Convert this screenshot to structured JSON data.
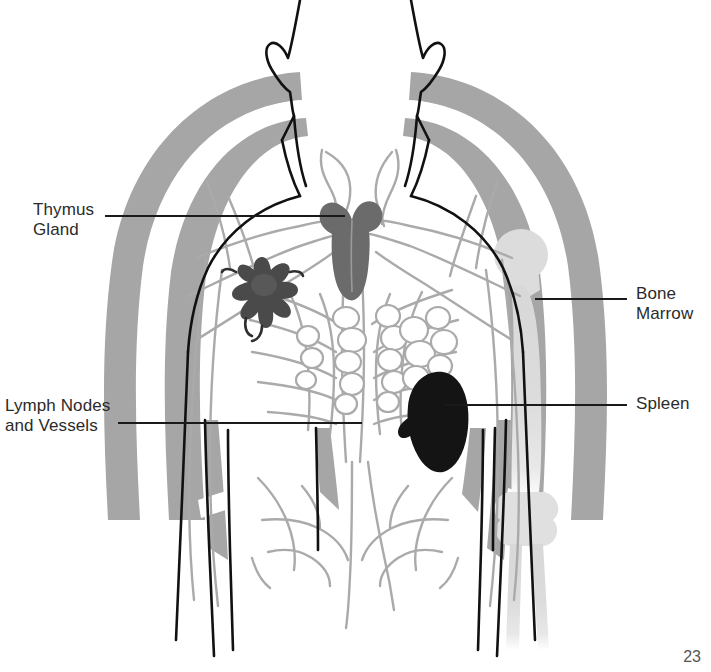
{
  "figure": {
    "page_number": "23",
    "background_color": "#ffffff",
    "labels": [
      {
        "id": "thymus",
        "text": "Thymus\nGland",
        "side": "left",
        "leader_line": {
          "x1": 105,
          "y1": 216,
          "x2": 345,
          "y2": 216
        }
      },
      {
        "id": "lymph",
        "text": "Lymph Nodes\nand Vessels",
        "side": "left",
        "leader_line": {
          "x1": 118,
          "y1": 423,
          "x2": 362,
          "y2": 423
        }
      },
      {
        "id": "bone-marrow",
        "text": "Bone\nMarrow",
        "side": "right",
        "leader_line": {
          "x1": 535,
          "y1": 299,
          "x2": 627,
          "y2": 299
        }
      },
      {
        "id": "spleen",
        "text": "Spleen",
        "side": "right",
        "leader_line": {
          "x1": 445,
          "y1": 405,
          "x2": 627,
          "y2": 405
        }
      }
    ],
    "organs": [
      {
        "name": "thymus-gland",
        "color": "#6b6b6b",
        "description": "butterfly shaped gland behind sternum"
      },
      {
        "name": "lymph-node",
        "color": "#4a4a4a",
        "description": "star shaped lymph node in left chest"
      },
      {
        "name": "spleen",
        "color": "#141414",
        "description": "bean shaped organ upper left abdomen"
      },
      {
        "name": "bone-marrow",
        "color": "#dcdcdc",
        "description": "humerus bone in right arm"
      },
      {
        "name": "lymph-vessels",
        "color": "#aaaaaa",
        "description": "network of vessels and node clusters"
      }
    ],
    "colors": {
      "outline": "#111111",
      "body_shading": "#a6a6a6",
      "vessel": "#a8a8a8",
      "bone": "#dcdcdc",
      "text": "#2b2b2b"
    }
  }
}
